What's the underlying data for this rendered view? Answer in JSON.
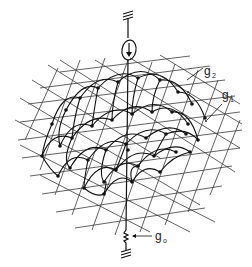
{
  "diagram": {
    "labels": {
      "g2": {
        "base": "g",
        "sub": "2"
      },
      "g1": {
        "base": "g",
        "sub": "1"
      },
      "g0": {
        "base": "g",
        "sub": "o"
      }
    },
    "elements": {
      "top_ground": "ground-symbol",
      "current_source": "circled-arrow-down",
      "bottom_resistor": "zigzag-resistor",
      "bottom_ground": "ground-symbol"
    },
    "colors": {
      "line": "#111111",
      "grid": "#3a3a3a",
      "background": "#ffffff"
    }
  }
}
